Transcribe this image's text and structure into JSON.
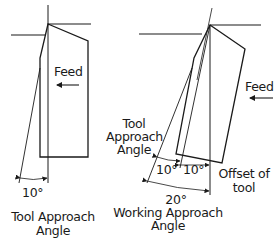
{
  "left_diagram": {
    "feed_label": "Feed",
    "angle_label": "10°",
    "caption_line1": "Tool Approach",
    "caption_line2": "Angle"
  },
  "right_diagram": {
    "feed_label": "Feed",
    "tool_angle_label_line1": "Tool",
    "tool_angle_label_line2": "Approach",
    "tool_angle_label_line3": "Angle",
    "angle_left_label": "10°",
    "angle_right_label": "10°",
    "offset_label_line1": "Offset of",
    "offset_label_line2": "tool",
    "total_angle_label": "20°",
    "caption_line1": "Working Approach",
    "caption_line2": "Angle"
  },
  "colors": {
    "line": "#1a1a1a",
    "background": "#ffffff"
  }
}
